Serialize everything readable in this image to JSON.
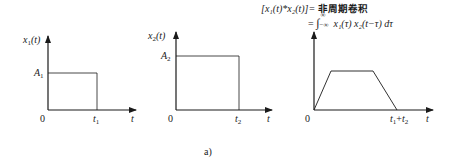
{
  "caption": "a)",
  "formula": {
    "line1_lhs": "[x₁(t)*x₂(t)]=",
    "line1_rhs": "非周期卷积",
    "line2": "= ∫₋∞^∞ x₁(τ) x₂(t−τ) dτ",
    "line2_integral": "∫",
    "line2_upper": "∞",
    "line2_lower": "−∞",
    "line2_body": "x₁(τ) x₂(t−τ) dτ"
  },
  "panels": [
    {
      "id": "x1",
      "y_label": "x",
      "y_label_sub": "1",
      "y_label_suffix": "(t)",
      "amplitude_label": "A",
      "amplitude_sub": "1",
      "origin_label": "0",
      "end_label": "t",
      "end_sub": "1",
      "x_axis_label": "t",
      "shape": "rectangle"
    },
    {
      "id": "x2",
      "y_label": "x",
      "y_label_sub": "2",
      "y_label_suffix": "(t)",
      "amplitude_label": "A",
      "amplitude_sub": "2",
      "origin_label": "0",
      "end_label": "t",
      "end_sub": "2",
      "x_axis_label": "t",
      "shape": "rectangle"
    },
    {
      "id": "convolution",
      "origin_label": "0",
      "end_label_a": "t",
      "end_sub_a": "1",
      "end_plus": "+",
      "end_label_b": "t",
      "end_sub_b": "2",
      "x_axis_label": "t",
      "shape": "trapezoid"
    }
  ],
  "colors": {
    "line": "#1a1a1a",
    "background": "#ffffff"
  }
}
